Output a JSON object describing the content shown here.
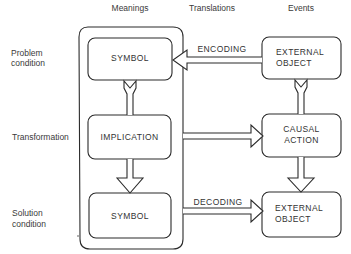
{
  "columns": {
    "meanings": "Meanings",
    "translations": "Translations",
    "events": "Events"
  },
  "rows": {
    "problem": [
      "Problem",
      "condition"
    ],
    "transformation": "Transformation",
    "solution": [
      "Solution",
      "condition"
    ]
  },
  "meanings_boxes": {
    "top": "SYMBOL",
    "middle": "IMPLICATION",
    "bottom": "SYMBOL"
  },
  "events_boxes": {
    "top": [
      "EXTERNAL",
      "OBJECT"
    ],
    "middle": [
      "CAUSAL",
      "ACTION"
    ],
    "bottom": [
      "EXTERNAL",
      "OBJECT"
    ]
  },
  "translations": {
    "encoding": "ENCODING",
    "decoding": "DECODING"
  },
  "colors": {
    "line": "#2b2b2b",
    "text": "#333333",
    "background": "#ffffff"
  }
}
